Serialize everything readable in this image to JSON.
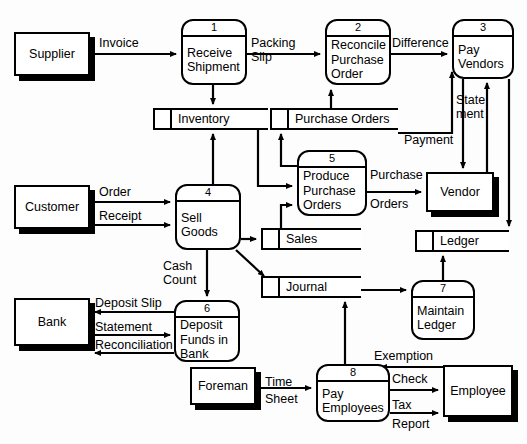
{
  "diagram": {
    "type": "data-flow-diagram",
    "stroke_color": "#000000",
    "background_color": "#fdfdfd"
  },
  "entities": [
    {
      "id": "supplier",
      "label": "Supplier",
      "x": 14,
      "y": 32,
      "w": 76,
      "h": 44
    },
    {
      "id": "customer",
      "label": "Customer",
      "x": 14,
      "y": 185,
      "w": 76,
      "h": 44
    },
    {
      "id": "bank",
      "label": "Bank",
      "x": 14,
      "y": 298,
      "w": 76,
      "h": 48
    },
    {
      "id": "foreman",
      "label": "Foreman",
      "x": 190,
      "y": 367,
      "w": 66,
      "h": 38
    },
    {
      "id": "vendor",
      "label": "Vendor",
      "x": 426,
      "y": 172,
      "w": 68,
      "h": 40
    },
    {
      "id": "employee",
      "label": "Employee",
      "x": 443,
      "y": 365,
      "w": 70,
      "h": 52
    }
  ],
  "processes": [
    {
      "id": "p1",
      "number": "1",
      "lines": [
        "Receive",
        "Shipment"
      ],
      "x": 181,
      "y": 19,
      "w": 66,
      "h": 66
    },
    {
      "id": "p2",
      "number": "2",
      "lines": [
        "Reconcile",
        "Purchase",
        "Order"
      ],
      "x": 325,
      "y": 19,
      "w": 66,
      "h": 66
    },
    {
      "id": "p3",
      "number": "3",
      "lines": [
        "Pay",
        "Vendors"
      ],
      "x": 452,
      "y": 19,
      "w": 62,
      "h": 60
    },
    {
      "id": "p4",
      "number": "4",
      "lines": [
        "Sell",
        "Goods"
      ],
      "x": 175,
      "y": 184,
      "w": 66,
      "h": 66
    },
    {
      "id": "p5",
      "number": "5",
      "lines": [
        "Produce",
        "Purchase",
        "Orders"
      ],
      "x": 297,
      "y": 150,
      "w": 70,
      "h": 66
    },
    {
      "id": "p6",
      "number": "6",
      "lines": [
        "Deposit",
        "Funds in",
        "Bank"
      ],
      "x": 174,
      "y": 300,
      "w": 66,
      "h": 62
    },
    {
      "id": "p7",
      "number": "7",
      "lines": [
        "Maintain",
        "Ledger"
      ],
      "x": 411,
      "y": 280,
      "w": 64,
      "h": 60
    },
    {
      "id": "p8",
      "number": "8",
      "lines": [
        "Pay",
        "Employees"
      ],
      "x": 316,
      "y": 364,
      "w": 74,
      "h": 58
    }
  ],
  "stores": [
    {
      "id": "inventory",
      "label": "Inventory",
      "x": 153,
      "y": 108,
      "w": 115,
      "h": 22
    },
    {
      "id": "purchase-orders",
      "label": "Purchase Orders",
      "x": 270,
      "y": 108,
      "w": 128,
      "h": 22
    },
    {
      "id": "sales",
      "label": "Sales",
      "x": 261,
      "y": 228,
      "w": 100,
      "h": 22
    },
    {
      "id": "journal",
      "label": "Journal",
      "x": 261,
      "y": 276,
      "w": 100,
      "h": 22
    },
    {
      "id": "ledger",
      "label": "Ledger",
      "x": 415,
      "y": 230,
      "w": 94,
      "h": 22
    }
  ],
  "flow_labels": [
    {
      "id": "invoice",
      "text": "Invoice",
      "x": 99,
      "y": 36
    },
    {
      "id": "packing",
      "text": "Packing",
      "x": 251,
      "y": 36
    },
    {
      "id": "slip",
      "text": "Slip",
      "x": 251,
      "y": 50
    },
    {
      "id": "difference",
      "text": "Difference",
      "x": 392,
      "y": 36
    },
    {
      "id": "statement-v",
      "text": "State",
      "x": 456,
      "y": 93
    },
    {
      "id": "ment-v",
      "text": "ment",
      "x": 456,
      "y": 107
    },
    {
      "id": "payment",
      "text": "Payment",
      "x": 404,
      "y": 133
    },
    {
      "id": "purchase",
      "text": "Purchase",
      "x": 370,
      "y": 168
    },
    {
      "id": "orders",
      "text": "Orders",
      "x": 370,
      "y": 197
    },
    {
      "id": "order",
      "text": "Order",
      "x": 99,
      "y": 185
    },
    {
      "id": "receipt",
      "text": "Receipt",
      "x": 99,
      "y": 209
    },
    {
      "id": "cash",
      "text": "Cash",
      "x": 163,
      "y": 259
    },
    {
      "id": "count",
      "text": "Count",
      "x": 163,
      "y": 273
    },
    {
      "id": "deposit-slip",
      "text": "Deposit Slip",
      "x": 95,
      "y": 296
    },
    {
      "id": "statement-b",
      "text": "Statement",
      "x": 95,
      "y": 320
    },
    {
      "id": "reconciliation",
      "text": "Reconciliation",
      "x": 95,
      "y": 338
    },
    {
      "id": "exemption",
      "text": "Exemption",
      "x": 374,
      "y": 349
    },
    {
      "id": "check",
      "text": "Check",
      "x": 392,
      "y": 372
    },
    {
      "id": "time",
      "text": "Time",
      "x": 265,
      "y": 375
    },
    {
      "id": "sheet",
      "text": "Sheet",
      "x": 265,
      "y": 392
    },
    {
      "id": "tax",
      "text": "Tax",
      "x": 392,
      "y": 398
    },
    {
      "id": "report",
      "text": "Report",
      "x": 392,
      "y": 417
    }
  ],
  "flows": [
    {
      "from": "supplier",
      "to": "p1",
      "label": "Invoice"
    },
    {
      "from": "p1",
      "to": "p2",
      "label": "Packing Slip"
    },
    {
      "from": "p1",
      "to": "inventory",
      "label": ""
    },
    {
      "from": "p2",
      "to": "p3",
      "label": "Difference"
    },
    {
      "from": "purchase-orders",
      "to": "p2",
      "label": ""
    },
    {
      "from": "purchase-orders",
      "to": "p3",
      "label": ""
    },
    {
      "from": "p3",
      "to": "vendor",
      "label": "Payment"
    },
    {
      "from": "vendor",
      "to": "p3",
      "label": "Statement"
    },
    {
      "from": "p3",
      "to": "ledger",
      "label": ""
    },
    {
      "from": "p5",
      "to": "purchase-orders",
      "label": ""
    },
    {
      "from": "p5",
      "to": "vendor",
      "label": "Purchase Orders"
    },
    {
      "from": "inventory",
      "to": "p5",
      "label": ""
    },
    {
      "from": "p4",
      "to": "inventory",
      "label": ""
    },
    {
      "from": "customer",
      "to": "p4",
      "label": "Order"
    },
    {
      "from": "customer",
      "to": "p4",
      "label": "Receipt"
    },
    {
      "from": "p4",
      "to": "sales",
      "label": ""
    },
    {
      "from": "p4",
      "to": "journal",
      "label": ""
    },
    {
      "from": "p4",
      "to": "p6",
      "label": "Cash Count"
    },
    {
      "from": "sales",
      "to": "p5",
      "label": ""
    },
    {
      "from": "p6",
      "to": "bank",
      "label": "Deposit Slip"
    },
    {
      "from": "bank",
      "to": "p6",
      "label": "Statement"
    },
    {
      "from": "p6",
      "to": "bank",
      "label": "Reconciliation"
    },
    {
      "from": "journal",
      "to": "p7",
      "label": ""
    },
    {
      "from": "p7",
      "to": "ledger",
      "label": ""
    },
    {
      "from": "foreman",
      "to": "p8",
      "label": "Time Sheet"
    },
    {
      "from": "p8",
      "to": "employee",
      "label": "Check"
    },
    {
      "from": "p8",
      "to": "employee",
      "label": "Tax Report"
    },
    {
      "from": "employee",
      "to": "p8",
      "label": "Exemption"
    },
    {
      "from": "p8",
      "to": "journal",
      "label": ""
    }
  ]
}
